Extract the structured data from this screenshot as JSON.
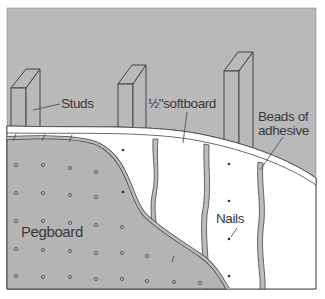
{
  "diagram": {
    "labels": {
      "studs": "Studs",
      "softboard": "½\"softboard",
      "beads_line1": "Beads of",
      "beads_line2": "adhesive",
      "nails": "Nails",
      "pegboard": "Pegboard"
    },
    "colors": {
      "wall_gray": "#b9b9b9",
      "line": "#444444",
      "board_white": "#ffffff",
      "pegboard_gray": "#b4b4b4"
    },
    "components": [
      "Studs",
      "1/2\" softboard",
      "Beads of adhesive",
      "Nails",
      "Pegboard"
    ]
  }
}
